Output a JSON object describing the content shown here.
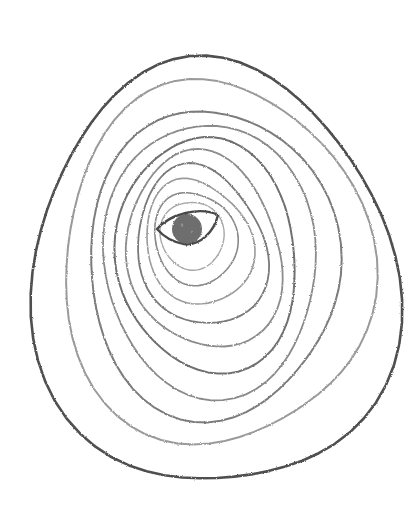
{
  "artwork": {
    "title": "Pencil sketch of concentric contour rings around an eye",
    "medium": "graphite pencil on white paper",
    "background": "#ffffff",
    "eye": {
      "cx": 188,
      "cy": 230,
      "outline_color": "#4a4a4a",
      "iris_color": "#6e6e6e"
    },
    "rings": [
      {
        "cx": 213,
        "cy": 275,
        "rx": 178,
        "ry": 218,
        "rot": -6,
        "color": "#505050",
        "width": 2.6
      },
      {
        "cx": 215,
        "cy": 262,
        "rx": 152,
        "ry": 185,
        "rot": -8,
        "color": "#9a9a9a",
        "width": 2.0
      },
      {
        "cx": 212,
        "cy": 262,
        "rx": 125,
        "ry": 155,
        "rot": -8,
        "color": "#7c7c7c",
        "width": 2.0
      },
      {
        "cx": 210,
        "cy": 258,
        "rx": 108,
        "ry": 135,
        "rot": -10,
        "color": "#8a8a8a",
        "width": 1.8
      },
      {
        "cx": 207,
        "cy": 254,
        "rx": 92,
        "ry": 115,
        "rot": -10,
        "color": "#707070",
        "width": 2.0
      },
      {
        "cx": 204,
        "cy": 250,
        "rx": 78,
        "ry": 97,
        "rot": -12,
        "color": "#8c8c8c",
        "width": 1.8
      },
      {
        "cx": 201,
        "cy": 246,
        "rx": 64,
        "ry": 80,
        "rot": -12,
        "color": "#7a7a7a",
        "width": 1.8
      },
      {
        "cx": 198,
        "cy": 242,
        "rx": 52,
        "ry": 64,
        "rot": -14,
        "color": "#9a9a9a",
        "width": 1.6
      },
      {
        "cx": 195,
        "cy": 238,
        "rx": 40,
        "ry": 48,
        "rot": -14,
        "color": "#8a8a8a",
        "width": 1.6
      },
      {
        "cx": 192,
        "cy": 235,
        "rx": 31,
        "ry": 35,
        "rot": -14,
        "color": "#a8a8a8",
        "width": 1.4
      }
    ]
  }
}
